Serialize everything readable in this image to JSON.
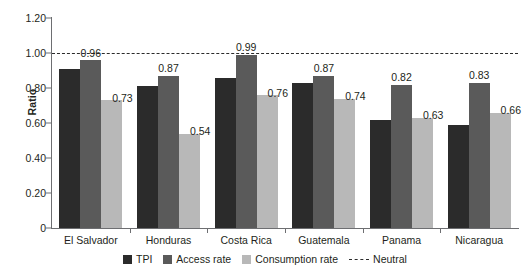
{
  "chart_data": {
    "type": "bar",
    "title": "",
    "xlabel": "",
    "ylabel": "Ratio",
    "ylim": [
      0,
      1.2
    ],
    "yticks": [
      "0",
      "0.20",
      "0.40",
      "0.60",
      "0.80",
      "1.00",
      "1.20"
    ],
    "ytick_values": [
      0,
      0.2,
      0.4,
      0.6,
      0.8,
      1.0,
      1.2
    ],
    "grid": false,
    "legend_position": "bottom",
    "categories": [
      "El Salvador",
      "Honduras",
      "Costa Rica",
      "Guatemala",
      "Panama",
      "Nicaragua"
    ],
    "series": [
      {
        "name": "TPI",
        "color": "#2b2b2b",
        "values": [
          0.91,
          0.81,
          0.86,
          0.83,
          0.62,
          0.59
        ],
        "labels": [
          "",
          "",
          "",
          "",
          "",
          ""
        ]
      },
      {
        "name": "Access rate",
        "color": "#5a5a5a",
        "values": [
          0.96,
          0.87,
          0.99,
          0.87,
          0.82,
          0.83
        ],
        "labels": [
          "0.96",
          "0.87",
          "0.99",
          "0.87",
          "0.82",
          "0.83"
        ]
      },
      {
        "name": "Consumption rate",
        "color": "#b8b8b8",
        "values": [
          0.73,
          0.54,
          0.76,
          0.74,
          0.63,
          0.66
        ],
        "labels": [
          "0.73",
          "0.54",
          "0.76",
          "0.74",
          "0.63",
          "0.66"
        ]
      }
    ],
    "reference_line": {
      "name": "Neutral",
      "value": 1.0,
      "style": "dashed",
      "color": "#2b2b2b"
    }
  },
  "legend": {
    "items": [
      {
        "label": "TPI",
        "key": "tpi"
      },
      {
        "label": "Access rate",
        "key": "access"
      },
      {
        "label": "Consumption rate",
        "key": "consumption"
      },
      {
        "label": "Neutral",
        "key": "neutral"
      }
    ]
  }
}
